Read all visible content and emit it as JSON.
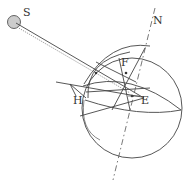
{
  "diagram": {
    "type": "geometric-astronomy",
    "labels": {
      "sun": "S",
      "north": "N",
      "point_f": "F",
      "point_h": "H",
      "point_e": "E"
    },
    "colors": {
      "line": "#444444",
      "sun_fill": "#cccccc",
      "background": "#ffffff"
    }
  }
}
